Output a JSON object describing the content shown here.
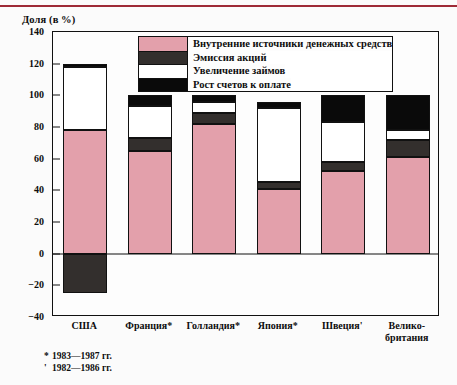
{
  "axis_title": "Доля (в %)",
  "colors": {
    "internal": "#e3a0ab",
    "shares": "#332f2d",
    "loans": "#ffffff",
    "payables": "#0a0a0a",
    "rule": "#9e2a36",
    "frame": "#111111"
  },
  "legend": {
    "items": [
      {
        "key": "internal",
        "label": "Внутренние источники денежных средств"
      },
      {
        "key": "shares",
        "label": "Эмиссия акций"
      },
      {
        "key": "loans",
        "label": "Увеличение займов"
      },
      {
        "key": "payables",
        "label": "Рост счетов к оплате"
      }
    ]
  },
  "footnotes": [
    {
      "mark": "*",
      "text": "1983—1987 гг."
    },
    {
      "mark": "'",
      "text": "1982—1986 гг."
    }
  ],
  "chart_data": {
    "type": "bar",
    "subtype": "stacked",
    "title": "",
    "xlabel": "",
    "ylabel": "Доля (в %)",
    "ylim": [
      -40,
      140
    ],
    "yticks": [
      140,
      120,
      100,
      80,
      60,
      40,
      20,
      0,
      -20,
      -40
    ],
    "ytick_labels": [
      "140",
      "120",
      "100",
      "80",
      "60",
      "40",
      "20",
      "0",
      "−20",
      "−40"
    ],
    "grid": false,
    "legend_position": "top-center",
    "categories": [
      "США",
      "Франция*",
      "Голландия*",
      "Япония*",
      "Швеция'",
      "Велико-\nбритания"
    ],
    "series": [
      {
        "name": "Внутренние источники денежных средств",
        "values": [
          78,
          65,
          82,
          41,
          52,
          61
        ]
      },
      {
        "name": "Эмиссия акций",
        "values": [
          0,
          8,
          7,
          4,
          6,
          11
        ]
      },
      {
        "name": "Увеличение займов",
        "values": [
          40,
          20,
          7,
          47,
          25,
          6
        ]
      },
      {
        "name": "Рост счетов к оплате",
        "values": [
          2,
          7,
          4,
          4,
          17,
          22
        ]
      },
      {
        "name": "Отрицательный сегмент",
        "values": [
          -25,
          0,
          0,
          0,
          0,
          0
        ]
      }
    ],
    "totals": [
      120,
      100,
      100,
      96,
      100,
      100
    ]
  }
}
